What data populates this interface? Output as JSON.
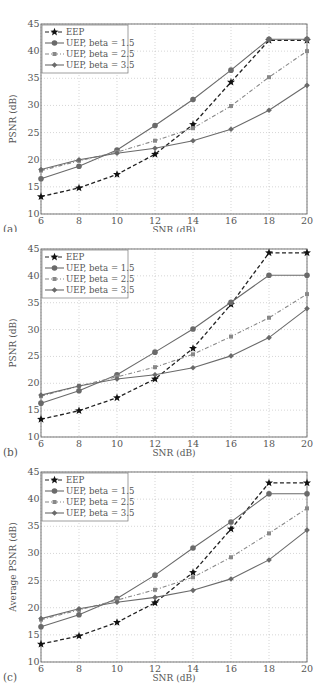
{
  "figure": {
    "panels": [
      "(a)",
      "(b)",
      "(c)"
    ]
  },
  "legend": {
    "entries": [
      "EEP",
      "UEP, beta = 1.5",
      "UEP, beta = 2.5",
      "UEP, beta = 3.5"
    ]
  },
  "chart_data": [
    {
      "type": "line",
      "panel_label": "(a)",
      "title": "",
      "xlabel": "SNR (dB)",
      "ylabel": "PSNR (dB)",
      "x": [
        6,
        8,
        10,
        12,
        14,
        16,
        18,
        20
      ],
      "xticks": [
        "6",
        "8",
        "10",
        "12",
        "14",
        "16",
        "18",
        "20"
      ],
      "yticks": [
        "10",
        "15",
        "20",
        "25",
        "30",
        "35",
        "40",
        "45"
      ],
      "xlim": [
        6,
        20
      ],
      "ylim": [
        10,
        45
      ],
      "grid": true,
      "legend_position": "upper left",
      "series": [
        {
          "name": "EEP",
          "style": "dashed",
          "marker": "star",
          "values": [
            13.2,
            14.8,
            17.3,
            21.0,
            26.5,
            34.3,
            42.0,
            42.0
          ]
        },
        {
          "name": "UEP, beta = 1.5",
          "style": "solid",
          "marker": "circle",
          "values": [
            16.5,
            18.8,
            21.8,
            26.3,
            31.1,
            36.5,
            42.2,
            42.2
          ]
        },
        {
          "name": "UEP, beta = 2.5",
          "style": "dashdot",
          "marker": "square",
          "values": [
            18.0,
            19.8,
            21.4,
            23.5,
            25.8,
            29.9,
            35.2,
            40.0
          ]
        },
        {
          "name": "UEP, beta = 3.5",
          "style": "solid",
          "marker": "diamond",
          "values": [
            18.2,
            20.0,
            21.2,
            22.1,
            23.5,
            25.6,
            29.1,
            33.7
          ]
        }
      ]
    },
    {
      "type": "line",
      "panel_label": "(b)",
      "title": "",
      "xlabel": "SNR (dB)",
      "ylabel": "PSNR (dB)",
      "x": [
        6,
        8,
        10,
        12,
        14,
        16,
        18,
        20
      ],
      "xticks": [
        "6",
        "8",
        "10",
        "12",
        "14",
        "16",
        "18",
        "20"
      ],
      "yticks": [
        "10",
        "15",
        "20",
        "25",
        "30",
        "35",
        "40",
        "45"
      ],
      "xlim": [
        6,
        20
      ],
      "ylim": [
        10,
        45
      ],
      "grid": true,
      "legend_position": "upper left",
      "series": [
        {
          "name": "EEP",
          "style": "dashed",
          "marker": "star",
          "values": [
            13.3,
            14.9,
            17.3,
            20.8,
            26.5,
            34.7,
            44.3,
            44.3
          ]
        },
        {
          "name": "UEP, beta = 1.5",
          "style": "solid",
          "marker": "circle",
          "values": [
            16.3,
            18.6,
            21.6,
            25.8,
            30.1,
            35.1,
            40.1,
            40.1
          ]
        },
        {
          "name": "UEP, beta = 2.5",
          "style": "dashdot",
          "marker": "square",
          "values": [
            17.6,
            19.5,
            21.2,
            23.0,
            25.4,
            28.7,
            32.2,
            36.6
          ]
        },
        {
          "name": "UEP, beta = 3.5",
          "style": "solid",
          "marker": "diamond",
          "values": [
            17.8,
            19.5,
            20.8,
            21.6,
            22.9,
            25.1,
            28.5,
            33.9
          ]
        }
      ]
    },
    {
      "type": "line",
      "panel_label": "(c)",
      "title": "",
      "xlabel": "SNR (dB)",
      "ylabel": "Average PSNR (dB)",
      "x": [
        6,
        8,
        10,
        12,
        14,
        16,
        18,
        20
      ],
      "xticks": [
        "6",
        "8",
        "10",
        "12",
        "14",
        "16",
        "18",
        "20"
      ],
      "yticks": [
        "10",
        "15",
        "20",
        "25",
        "30",
        "35",
        "40",
        "45"
      ],
      "xlim": [
        6,
        20
      ],
      "ylim": [
        10,
        45
      ],
      "grid": true,
      "legend_position": "upper left",
      "series": [
        {
          "name": "EEP",
          "style": "dashed",
          "marker": "star",
          "values": [
            13.3,
            14.8,
            17.3,
            20.9,
            26.5,
            34.5,
            43.0,
            43.0
          ]
        },
        {
          "name": "UEP, beta = 1.5",
          "style": "solid",
          "marker": "circle",
          "values": [
            16.5,
            18.7,
            21.7,
            26.0,
            31.0,
            35.8,
            41.0,
            41.0
          ]
        },
        {
          "name": "UEP, beta = 2.5",
          "style": "dashdot",
          "marker": "square",
          "values": [
            17.8,
            19.6,
            21.4,
            23.3,
            25.6,
            29.3,
            33.7,
            38.3
          ]
        },
        {
          "name": "UEP, beta = 3.5",
          "style": "solid",
          "marker": "diamond",
          "values": [
            18.0,
            19.8,
            21.0,
            21.9,
            23.2,
            25.3,
            28.8,
            34.3
          ]
        }
      ]
    }
  ]
}
